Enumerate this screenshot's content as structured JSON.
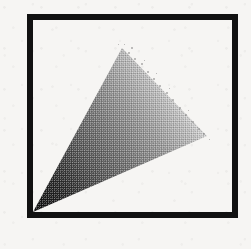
{
  "figure": {
    "canvas": {
      "width": 251,
      "height": 249
    },
    "background_color": "#f6f5f3",
    "frame": {
      "name": "square-border",
      "shape": "square",
      "stroke_color": "#111111",
      "stroke_width": 6,
      "left": 30,
      "top": 17,
      "right": 235,
      "bottom": 215
    },
    "triangle": {
      "name": "gradient-triangle",
      "fill_style": "dithered-halftone-gradient",
      "dark_color": "#1a1a1a",
      "mid_color": "#8c8c8c",
      "light_color": "#ffffff",
      "gradient_direction": "bottom-left (dark) to upper-right (light)",
      "vertices": [
        {
          "label": "apex-bottom-left",
          "x": 33,
          "y": 212
        },
        {
          "label": "vertex-top",
          "x": 122,
          "y": 48
        },
        {
          "label": "vertex-right",
          "x": 207,
          "y": 136
        }
      ]
    }
  }
}
